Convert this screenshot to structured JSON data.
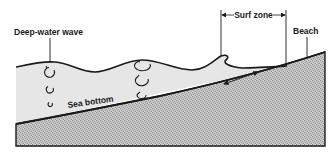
{
  "diagram": {
    "type": "cross-section",
    "labels": {
      "deep_water_wave": "Deep-water wave",
      "surf_zone": "Surf zone",
      "beach": "Beach",
      "sea_bottom": "Sea bottom"
    },
    "colors": {
      "water": "#e6e6e6",
      "sediment": "#bdbdbd",
      "line": "#1a1a1a",
      "background": "#ffffff"
    },
    "orbits": {
      "deep_water": [
        {
          "cx": 50,
          "cy": 72,
          "rx": 5,
          "ry": 5
        },
        {
          "cx": 50,
          "cy": 89,
          "rx": 3.5,
          "ry": 3.5
        },
        {
          "cx": 50,
          "cy": 104,
          "rx": 2.2,
          "ry": 2.2
        }
      ],
      "shoaling": [
        {
          "cx": 143,
          "cy": 65,
          "rx": 8,
          "ry": 5
        },
        {
          "cx": 142,
          "cy": 80,
          "rx": 6.5,
          "ry": 5
        },
        {
          "cx": 142,
          "cy": 95,
          "rx": 4.5,
          "ry": 3
        }
      ]
    }
  }
}
